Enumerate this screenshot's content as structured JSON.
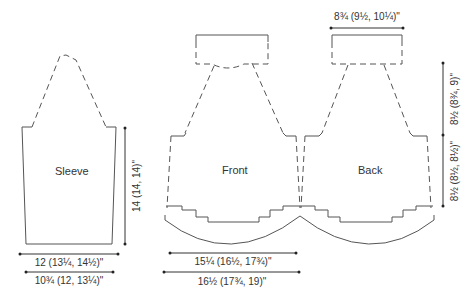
{
  "pieces": {
    "sleeve": {
      "label": "Sleeve"
    },
    "front": {
      "label": "Front"
    },
    "back": {
      "label": "Back"
    }
  },
  "dimensions": {
    "sleeve_length": "14 (14, 14)\"",
    "sleeve_upper_width": "12 (13¼, 14½)\"",
    "sleeve_lower_width": "10¾ (12, 13¼)\"",
    "front_hem_width": "15¼ (16½, 17¾)\"",
    "front_chest_width": "16½ (17¾, 19)\"",
    "back_neck_width": "8¾ (9½, 10¼)\"",
    "back_armhole_depth": "8½ (8¾, 9)\"",
    "back_side_length": "8½ (8½, 8½)\""
  }
}
